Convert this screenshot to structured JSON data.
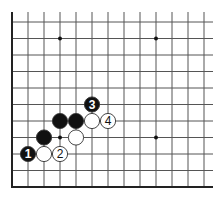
{
  "diagram": {
    "type": "go-board-partial",
    "grid": {
      "origin_x": 12,
      "origin_y": 22,
      "step_x": 16,
      "step_y": 16.5,
      "columns": 13,
      "rows": 10,
      "top_line_start_y": 12,
      "right_extent_x": 213,
      "bottom_edge_y": 187,
      "left_edge_x": 12
    },
    "star_points": [
      {
        "col": 3,
        "row": 1
      },
      {
        "col": 9,
        "row": 1
      },
      {
        "col": 3,
        "row": 7
      },
      {
        "col": 9,
        "row": 7
      }
    ],
    "stones": [
      {
        "color": "black",
        "col": 5,
        "row": 5,
        "label": "3"
      },
      {
        "color": "black",
        "col": 3,
        "row": 6,
        "label": ""
      },
      {
        "color": "black",
        "col": 4,
        "row": 6,
        "label": ""
      },
      {
        "color": "white",
        "col": 5,
        "row": 6,
        "label": ""
      },
      {
        "color": "white",
        "col": 6,
        "row": 6,
        "label": "4"
      },
      {
        "color": "black",
        "col": 2,
        "row": 7,
        "label": ""
      },
      {
        "color": "white",
        "col": 4,
        "row": 7,
        "label": ""
      },
      {
        "color": "black",
        "col": 1,
        "row": 8,
        "label": "1"
      },
      {
        "color": "white",
        "col": 2,
        "row": 8,
        "label": ""
      },
      {
        "color": "white",
        "col": 3,
        "row": 8,
        "label": "2"
      }
    ],
    "colors": {
      "line": "#555555",
      "edge": "#222222",
      "black_stone": "#111111",
      "white_stone": "#ffffff",
      "stone_outline": "#333333"
    }
  }
}
